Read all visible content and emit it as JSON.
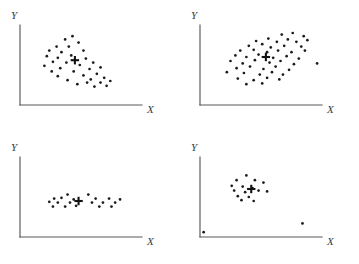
{
  "figure": {
    "title": "",
    "panel_count": 4,
    "marker_color": "#1b1b1b",
    "axis_color": "#58585a",
    "centroid_color": "#121212",
    "background": "#ffffff"
  },
  "axes_labels": {
    "x": "X",
    "y": "Y"
  },
  "chart_data": [
    {
      "type": "scatter",
      "title": "",
      "name": "negative-correlation-scatter",
      "position": "top-left",
      "xlabel": "X",
      "ylabel": "Y",
      "xlim": [
        0,
        100
      ],
      "ylim": [
        0,
        100
      ],
      "grid": false,
      "legend": "none",
      "annotations": [
        {
          "label": "centroid",
          "marker": "plus",
          "x": 45,
          "y": 56
        }
      ],
      "points": [
        {
          "x": 37,
          "y": 82
        },
        {
          "x": 43,
          "y": 86
        },
        {
          "x": 30,
          "y": 73
        },
        {
          "x": 40,
          "y": 73
        },
        {
          "x": 48,
          "y": 78
        },
        {
          "x": 24,
          "y": 68
        },
        {
          "x": 34,
          "y": 66
        },
        {
          "x": 52,
          "y": 68
        },
        {
          "x": 22,
          "y": 61
        },
        {
          "x": 31,
          "y": 59
        },
        {
          "x": 42,
          "y": 62
        },
        {
          "x": 27,
          "y": 54
        },
        {
          "x": 38,
          "y": 53
        },
        {
          "x": 54,
          "y": 58
        },
        {
          "x": 20,
          "y": 49
        },
        {
          "x": 33,
          "y": 46
        },
        {
          "x": 49,
          "y": 50
        },
        {
          "x": 60,
          "y": 53
        },
        {
          "x": 26,
          "y": 42
        },
        {
          "x": 44,
          "y": 42
        },
        {
          "x": 57,
          "y": 45
        },
        {
          "x": 66,
          "y": 47
        },
        {
          "x": 31,
          "y": 36
        },
        {
          "x": 52,
          "y": 37
        },
        {
          "x": 63,
          "y": 39
        },
        {
          "x": 39,
          "y": 31
        },
        {
          "x": 58,
          "y": 32
        },
        {
          "x": 69,
          "y": 34
        },
        {
          "x": 47,
          "y": 26
        },
        {
          "x": 55,
          "y": 28
        },
        {
          "x": 66,
          "y": 28
        },
        {
          "x": 74,
          "y": 30
        },
        {
          "x": 61,
          "y": 23
        },
        {
          "x": 71,
          "y": 24
        }
      ]
    },
    {
      "type": "scatter",
      "title": "",
      "name": "positive-correlation-scatter",
      "position": "top-right",
      "xlabel": "X",
      "ylabel": "Y",
      "xlim": [
        0,
        100
      ],
      "ylim": [
        0,
        100
      ],
      "grid": false,
      "legend": "none",
      "annotations": [
        {
          "label": "centroid",
          "marker": "plus",
          "x": 54,
          "y": 60
        }
      ],
      "points": [
        {
          "x": 67,
          "y": 88
        },
        {
          "x": 76,
          "y": 90
        },
        {
          "x": 85,
          "y": 86
        },
        {
          "x": 46,
          "y": 80
        },
        {
          "x": 56,
          "y": 83
        },
        {
          "x": 63,
          "y": 79
        },
        {
          "x": 72,
          "y": 82
        },
        {
          "x": 79,
          "y": 79
        },
        {
          "x": 88,
          "y": 81
        },
        {
          "x": 40,
          "y": 74
        },
        {
          "x": 51,
          "y": 76
        },
        {
          "x": 58,
          "y": 72
        },
        {
          "x": 69,
          "y": 74
        },
        {
          "x": 83,
          "y": 73
        },
        {
          "x": 33,
          "y": 68
        },
        {
          "x": 44,
          "y": 69
        },
        {
          "x": 55,
          "y": 66
        },
        {
          "x": 64,
          "y": 68
        },
        {
          "x": 75,
          "y": 66
        },
        {
          "x": 86,
          "y": 68
        },
        {
          "x": 29,
          "y": 62
        },
        {
          "x": 38,
          "y": 60
        },
        {
          "x": 48,
          "y": 63
        },
        {
          "x": 60,
          "y": 59
        },
        {
          "x": 71,
          "y": 61
        },
        {
          "x": 81,
          "y": 58
        },
        {
          "x": 25,
          "y": 55
        },
        {
          "x": 35,
          "y": 52
        },
        {
          "x": 45,
          "y": 56
        },
        {
          "x": 57,
          "y": 53
        },
        {
          "x": 66,
          "y": 55
        },
        {
          "x": 77,
          "y": 51
        },
        {
          "x": 96,
          "y": 52
        },
        {
          "x": 30,
          "y": 46
        },
        {
          "x": 41,
          "y": 48
        },
        {
          "x": 52,
          "y": 45
        },
        {
          "x": 62,
          "y": 48
        },
        {
          "x": 73,
          "y": 44
        },
        {
          "x": 22,
          "y": 41
        },
        {
          "x": 36,
          "y": 40
        },
        {
          "x": 49,
          "y": 38
        },
        {
          "x": 59,
          "y": 41
        },
        {
          "x": 68,
          "y": 38
        },
        {
          "x": 31,
          "y": 33
        },
        {
          "x": 44,
          "y": 31
        },
        {
          "x": 55,
          "y": 34
        },
        {
          "x": 65,
          "y": 32
        },
        {
          "x": 38,
          "y": 26
        },
        {
          "x": 51,
          "y": 27
        }
      ]
    },
    {
      "type": "scatter",
      "title": "",
      "name": "horizontal-band-scatter",
      "position": "bottom-left",
      "xlabel": "X",
      "ylabel": "Y",
      "xlim": [
        0,
        100
      ],
      "ylim": [
        0,
        100
      ],
      "grid": false,
      "legend": "none",
      "annotations": [
        {
          "label": "centroid",
          "marker": "plus",
          "x": 48,
          "y": 45
        }
      ],
      "points": [
        {
          "x": 39,
          "y": 53
        },
        {
          "x": 56,
          "y": 53
        },
        {
          "x": 28,
          "y": 48
        },
        {
          "x": 34,
          "y": 49
        },
        {
          "x": 44,
          "y": 47
        },
        {
          "x": 62,
          "y": 48
        },
        {
          "x": 73,
          "y": 48
        },
        {
          "x": 82,
          "y": 47
        },
        {
          "x": 24,
          "y": 44
        },
        {
          "x": 31,
          "y": 43
        },
        {
          "x": 41,
          "y": 43
        },
        {
          "x": 59,
          "y": 43
        },
        {
          "x": 68,
          "y": 43
        },
        {
          "x": 78,
          "y": 43
        },
        {
          "x": 27,
          "y": 38
        },
        {
          "x": 37,
          "y": 38
        },
        {
          "x": 46,
          "y": 39
        },
        {
          "x": 65,
          "y": 38
        },
        {
          "x": 75,
          "y": 38
        }
      ]
    },
    {
      "type": "scatter",
      "title": "",
      "name": "tight-cluster-with-outliers-scatter",
      "position": "bottom-right",
      "xlabel": "X",
      "ylabel": "Y",
      "xlim": [
        0,
        100
      ],
      "ylim": [
        0,
        100
      ],
      "grid": false,
      "legend": "none",
      "annotations": [
        {
          "label": "centroid",
          "marker": "plus",
          "x": 42,
          "y": 60
        }
      ],
      "points": [
        {
          "x": 38,
          "y": 77
        },
        {
          "x": 30,
          "y": 71
        },
        {
          "x": 45,
          "y": 71
        },
        {
          "x": 52,
          "y": 68
        },
        {
          "x": 26,
          "y": 64
        },
        {
          "x": 35,
          "y": 63
        },
        {
          "x": 43,
          "y": 61
        },
        {
          "x": 28,
          "y": 58
        },
        {
          "x": 37,
          "y": 56
        },
        {
          "x": 48,
          "y": 58
        },
        {
          "x": 55,
          "y": 57
        },
        {
          "x": 31,
          "y": 51
        },
        {
          "x": 40,
          "y": 50
        },
        {
          "x": 34,
          "y": 46
        },
        {
          "x": 44,
          "y": 45
        },
        {
          "x": 84,
          "y": 17
        },
        {
          "x": 3,
          "y": 6
        }
      ]
    }
  ]
}
